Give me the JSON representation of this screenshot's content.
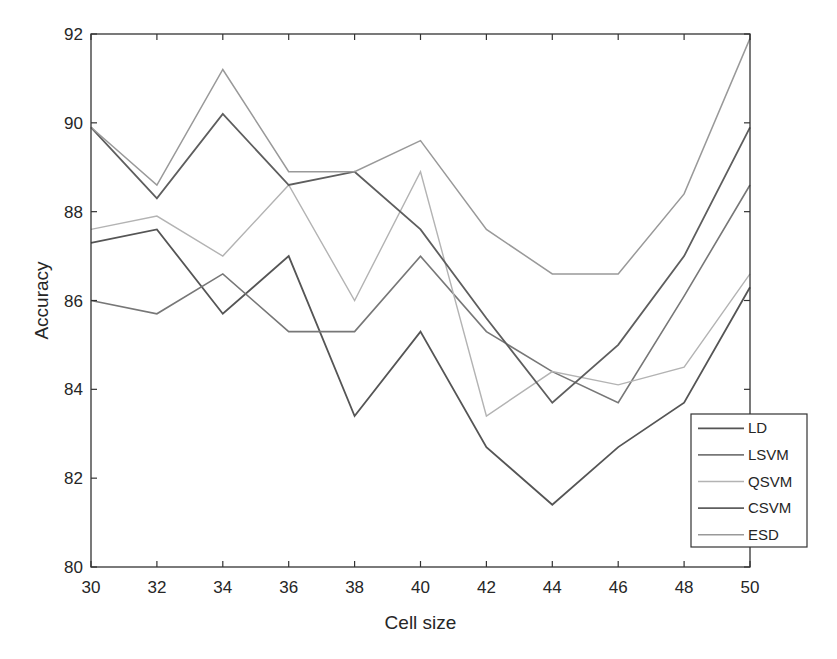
{
  "chart_data": {
    "type": "line",
    "title": "",
    "xlabel": "Cell size",
    "ylabel": "Accuracy",
    "x": [
      30,
      32,
      34,
      36,
      38,
      40,
      42,
      44,
      46,
      48,
      50
    ],
    "xlim": [
      30,
      50
    ],
    "ylim": [
      80,
      92
    ],
    "xticks": [
      30,
      32,
      34,
      36,
      38,
      40,
      42,
      44,
      46,
      48,
      50
    ],
    "yticks": [
      80,
      82,
      84,
      86,
      88,
      90,
      92
    ],
    "grid": false,
    "legend_position": "lower right",
    "series": [
      {
        "name": "LD",
        "color": "#555555",
        "width": 1.8,
        "values": [
          87.3,
          87.6,
          85.7,
          87.0,
          83.4,
          85.3,
          82.7,
          81.4,
          82.7,
          83.7,
          86.3
        ]
      },
      {
        "name": "LSVM",
        "color": "#777777",
        "width": 1.6,
        "values": [
          86.0,
          85.7,
          86.6,
          85.3,
          85.3,
          87.0,
          85.3,
          84.4,
          83.7,
          86.1,
          88.6
        ]
      },
      {
        "name": "QSVM",
        "color": "#b3b3b3",
        "width": 1.4,
        "values": [
          87.6,
          87.9,
          87.0,
          88.6,
          86.0,
          88.9,
          83.4,
          84.4,
          84.1,
          84.5,
          86.6
        ]
      },
      {
        "name": "CSVM",
        "color": "#5e5e5e",
        "width": 1.8,
        "values": [
          89.9,
          88.3,
          90.2,
          88.6,
          88.9,
          87.6,
          85.6,
          83.7,
          85.0,
          87.0,
          89.9
        ]
      },
      {
        "name": "ESD",
        "color": "#999999",
        "width": 1.5,
        "values": [
          89.9,
          88.6,
          91.2,
          88.9,
          88.9,
          89.6,
          87.6,
          86.6,
          86.6,
          88.4,
          91.9
        ]
      }
    ]
  },
  "layout": {
    "plot": {
      "left": 91,
      "top": 34,
      "right": 750,
      "bottom": 567
    },
    "legend": {
      "left": 691,
      "top": 414,
      "width": 116,
      "height": 133
    }
  }
}
